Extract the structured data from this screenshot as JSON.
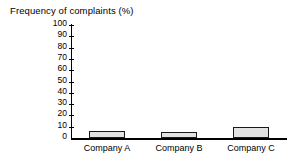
{
  "chart_data": {
    "type": "bar",
    "title": "Frequency of complaints (%)",
    "xlabel": "",
    "ylabel": "Frequency of complaints (%)",
    "categories": [
      "Company A",
      "Company B",
      "Company C"
    ],
    "values": [
      6,
      5,
      10
    ],
    "series": [
      {
        "name": "Frequency of complaints (%)",
        "values": [
          6,
          5,
          10
        ]
      }
    ],
    "ylim": [
      0,
      100
    ],
    "ytick_step": 10,
    "yticks": [
      100,
      90,
      80,
      70,
      60,
      50,
      40,
      30,
      20,
      10,
      0
    ],
    "ytick_labels": [
      "100",
      "90",
      "80",
      "70",
      "60",
      "50",
      "40",
      "30",
      "20",
      "10",
      "0"
    ],
    "grid": false,
    "legend": false,
    "legend_position": "none",
    "bar_fill_color": "#e3e3e3",
    "bar_edge_color": "#1a1a1a",
    "axis_color": "#000000",
    "background_color": "#ffffff"
  }
}
